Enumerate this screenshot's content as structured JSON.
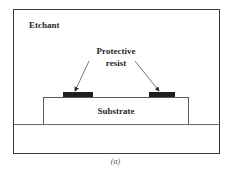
{
  "diagram": {
    "type": "etching-process-schematic",
    "labels": {
      "etchant": "Etchant",
      "protective_resist_line1": "Protective",
      "protective_resist_line2": "resist",
      "substrate": "Substrate"
    },
    "caption": "(a)",
    "elements": [
      {
        "id": "etchant-region",
        "label": "Etchant"
      },
      {
        "id": "resist-left",
        "label": "Protective resist"
      },
      {
        "id": "resist-right",
        "label": "Protective resist"
      },
      {
        "id": "substrate",
        "label": "Substrate"
      },
      {
        "id": "base",
        "label": ""
      }
    ],
    "arrows": [
      {
        "from": "Protective resist label",
        "to": "resist-left"
      },
      {
        "from": "Protective resist label",
        "to": "resist-right"
      }
    ],
    "colors": {
      "frame": "#3a3a3a",
      "resist": "#1e1e1e",
      "text": "#2a2a2a",
      "background": "#ffffff"
    }
  }
}
